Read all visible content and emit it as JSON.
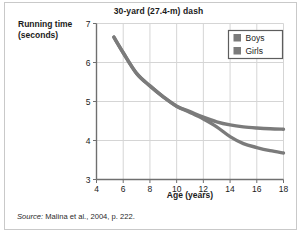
{
  "figure": {
    "source_note_keyword": "Source:",
    "source_note_text": " Malina et al., 2004, p. 222."
  },
  "chart_data": {
    "type": "line",
    "title": "30-yard (27.4-m) dash",
    "xlabel": "Age (years)",
    "ylabel_line1": "Running time",
    "ylabel_line2": "(seconds)",
    "xlim": [
      4,
      18
    ],
    "ylim": [
      3,
      7
    ],
    "xticks": [
      4,
      6,
      8,
      10,
      12,
      14,
      16,
      18
    ],
    "yticks": [
      3,
      4,
      5,
      6,
      7
    ],
    "grid": true,
    "legend_position": "top-right",
    "line_color": "#7b7b7b",
    "grid_color": "#d5d5d5",
    "axis_color": "#6f6f6f",
    "series": [
      {
        "name": "Boys",
        "color": "#7b7b7b",
        "x": [
          5.3,
          6,
          7,
          8,
          9,
          10,
          11,
          12,
          13,
          14,
          15,
          16,
          17,
          18
        ],
        "values": [
          6.65,
          6.25,
          5.72,
          5.4,
          5.12,
          4.88,
          4.72,
          4.55,
          4.35,
          4.1,
          3.92,
          3.82,
          3.74,
          3.68
        ]
      },
      {
        "name": "Girls",
        "color": "#7b7b7b",
        "x": [
          5.3,
          6,
          7,
          8,
          9,
          10,
          11,
          12,
          13,
          14,
          15,
          16,
          17,
          18
        ],
        "values": [
          6.65,
          6.25,
          5.72,
          5.4,
          5.12,
          4.88,
          4.74,
          4.6,
          4.48,
          4.4,
          4.35,
          4.32,
          4.3,
          4.29
        ]
      }
    ]
  }
}
